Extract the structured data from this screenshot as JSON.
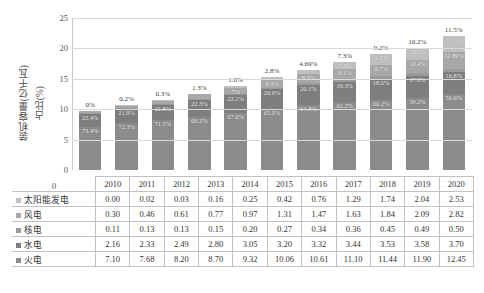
{
  "axis": {
    "y_title_line1": "装机容量(亿千瓦)",
    "y_title_line2": "占比(%)",
    "y_ticks": [
      "25",
      "20",
      "15",
      "10",
      "5",
      "0"
    ],
    "y_zero_label": "0"
  },
  "chart_data": {
    "type": "bar",
    "title": "",
    "xlabel": "",
    "ylabel": "装机容量(亿千瓦)占比(%)",
    "ylim": [
      0,
      25
    ],
    "grid": true,
    "stacked": true,
    "legend_position": "table-left",
    "categories": [
      "2010",
      "2011",
      "2012",
      "2013",
      "2014",
      "2015",
      "2016",
      "2017",
      "2018",
      "2019",
      "2020"
    ],
    "series": [
      {
        "name": "火电",
        "color": "#8c8c8c",
        "values": [
          7.1,
          7.68,
          8.2,
          8.7,
          9.32,
          10.06,
          10.61,
          11.1,
          11.44,
          11.9,
          12.45
        ],
        "share_labels": [
          "73.4%",
          "72.3%",
          "71.5%",
          "69.2%",
          "67.6%",
          "65.9%",
          "64.3%",
          "62.2%",
          "60.2%",
          "59.2%",
          "56.6%"
        ]
      },
      {
        "name": "水电",
        "color": "#7e7e7e",
        "values": [
          2.16,
          2.33,
          2.49,
          2.8,
          3.05,
          3.2,
          3.32,
          3.44,
          3.53,
          3.58,
          3.7
        ],
        "share_labels": [
          "22.4%",
          "21.9%",
          "21.8%",
          "22.3%",
          "22.1%",
          "20.9%",
          "20.1%",
          "19.3%",
          "18.6%",
          "17.8%",
          "16.8%"
        ]
      },
      {
        "name": "核电",
        "color": "#9a9a9a",
        "values": [
          0.11,
          0.13,
          0.13,
          0.15,
          0.2,
          0.27,
          0.34,
          0.36,
          0.45,
          0.49,
          0.5
        ],
        "share_labels": [
          "1.1%",
          "1.2%",
          "1.1%",
          "1.2%",
          "1.5%",
          "1.8%",
          "2%",
          "2%",
          "2.4%",
          "2.4%",
          "2.3%"
        ]
      },
      {
        "name": "风电",
        "color": "#a8a8a8",
        "values": [
          0.3,
          0.46,
          0.61,
          0.77,
          0.97,
          1.31,
          1.47,
          1.63,
          1.84,
          2.09,
          2.82
        ],
        "share_labels": [
          "3.1%",
          "4.4%",
          "5.4%",
          "6.1%",
          "7%",
          "8.4%",
          "8.9%",
          "9.1%",
          "9.7%",
          "10.4%",
          "12.89%"
        ]
      },
      {
        "name": "太阳能发电",
        "color": "#bfbfbf",
        "values": [
          0.0,
          0.02,
          0.03,
          0.16,
          0.25,
          0.42,
          0.76,
          1.29,
          1.74,
          2.04,
          2.53
        ],
        "share_labels": [
          "0%",
          "0.2%",
          "0.3%",
          "1.3%",
          "1.8%",
          "2.8%",
          "4.69%",
          "7.3%",
          "9.2%",
          "10.2%",
          "11.5%"
        ]
      }
    ],
    "totals": [
      9.67,
      10.62,
      11.46,
      12.58,
      13.79,
      15.26,
      16.5,
      17.82,
      19.0,
      20.1,
      22.0
    ]
  },
  "table": {
    "year_header": [
      "2010",
      "2011",
      "2012",
      "2013",
      "2014",
      "2015",
      "2016",
      "2017",
      "2018",
      "2019",
      "2020"
    ],
    "rows": [
      {
        "label": "太阳能发电",
        "color": "#bfbfbf",
        "values": [
          "0.00",
          "0.02",
          "0.03",
          "0.16",
          "0.25",
          "0.42",
          "0.76",
          "1.29",
          "1.74",
          "2.04",
          "2.53"
        ]
      },
      {
        "label": "风电",
        "color": "#a8a8a8",
        "values": [
          "0.30",
          "0.46",
          "0.61",
          "0.77",
          "0.97",
          "1.31",
          "1.47",
          "1.63",
          "1.84",
          "2.09",
          "2.82"
        ]
      },
      {
        "label": "核电",
        "color": "#9a9a9a",
        "values": [
          "0.11",
          "0.13",
          "0.13",
          "0.15",
          "0.20",
          "0.27",
          "0.34",
          "0.36",
          "0.45",
          "0.49",
          "0.50"
        ]
      },
      {
        "label": "水电",
        "color": "#7e7e7e",
        "values": [
          "2.16",
          "2.33",
          "2.49",
          "2.80",
          "3.05",
          "3.20",
          "3.32",
          "3.44",
          "3.53",
          "3.58",
          "3.70"
        ]
      },
      {
        "label": "火电",
        "color": "#8c8c8c",
        "values": [
          "7.10",
          "7.68",
          "8.20",
          "8.70",
          "9.32",
          "10.06",
          "10.61",
          "11.10",
          "11.44",
          "11.90",
          "12.45"
        ]
      }
    ]
  }
}
